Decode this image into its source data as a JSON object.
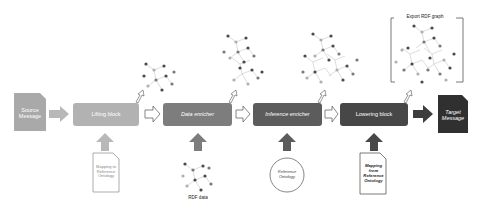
{
  "diagram": {
    "colors": {
      "source": "#a9a9a9",
      "lifting": "#b2b2b2",
      "data_enricher": "#7d7d7d",
      "inference_enricher": "#5c5c5c",
      "lowering": "#474747",
      "target": "#303030",
      "node_dark": "#4a4a4a",
      "node_mid": "#7a7a7a",
      "node_light": "#b0b0b0"
    },
    "source_message": {
      "label": "Source Message"
    },
    "blocks": [
      {
        "id": "lifting",
        "label": "Lifting block",
        "italic": false
      },
      {
        "id": "data_enricher",
        "label": "Data enricher",
        "italic": true
      },
      {
        "id": "inference_enricher",
        "label": "Inference enricher",
        "italic": true
      },
      {
        "id": "lowering",
        "label": "Lowering block",
        "italic": false
      }
    ],
    "target_message": {
      "label": "Target Message"
    },
    "inputs": [
      {
        "id": "mapping_to_ref",
        "label": "Mapping to Reference Ontology",
        "shape": "document"
      },
      {
        "id": "rdf_data",
        "label": "RDF data",
        "shape": "graph"
      },
      {
        "id": "ref_ontology",
        "label": "Reference Ontology",
        "shape": "circle"
      },
      {
        "id": "mapping_from_ref",
        "label": "Mapping from Reference Ontology",
        "shape": "document"
      }
    ],
    "export": {
      "label": "Export RDF graph"
    }
  }
}
